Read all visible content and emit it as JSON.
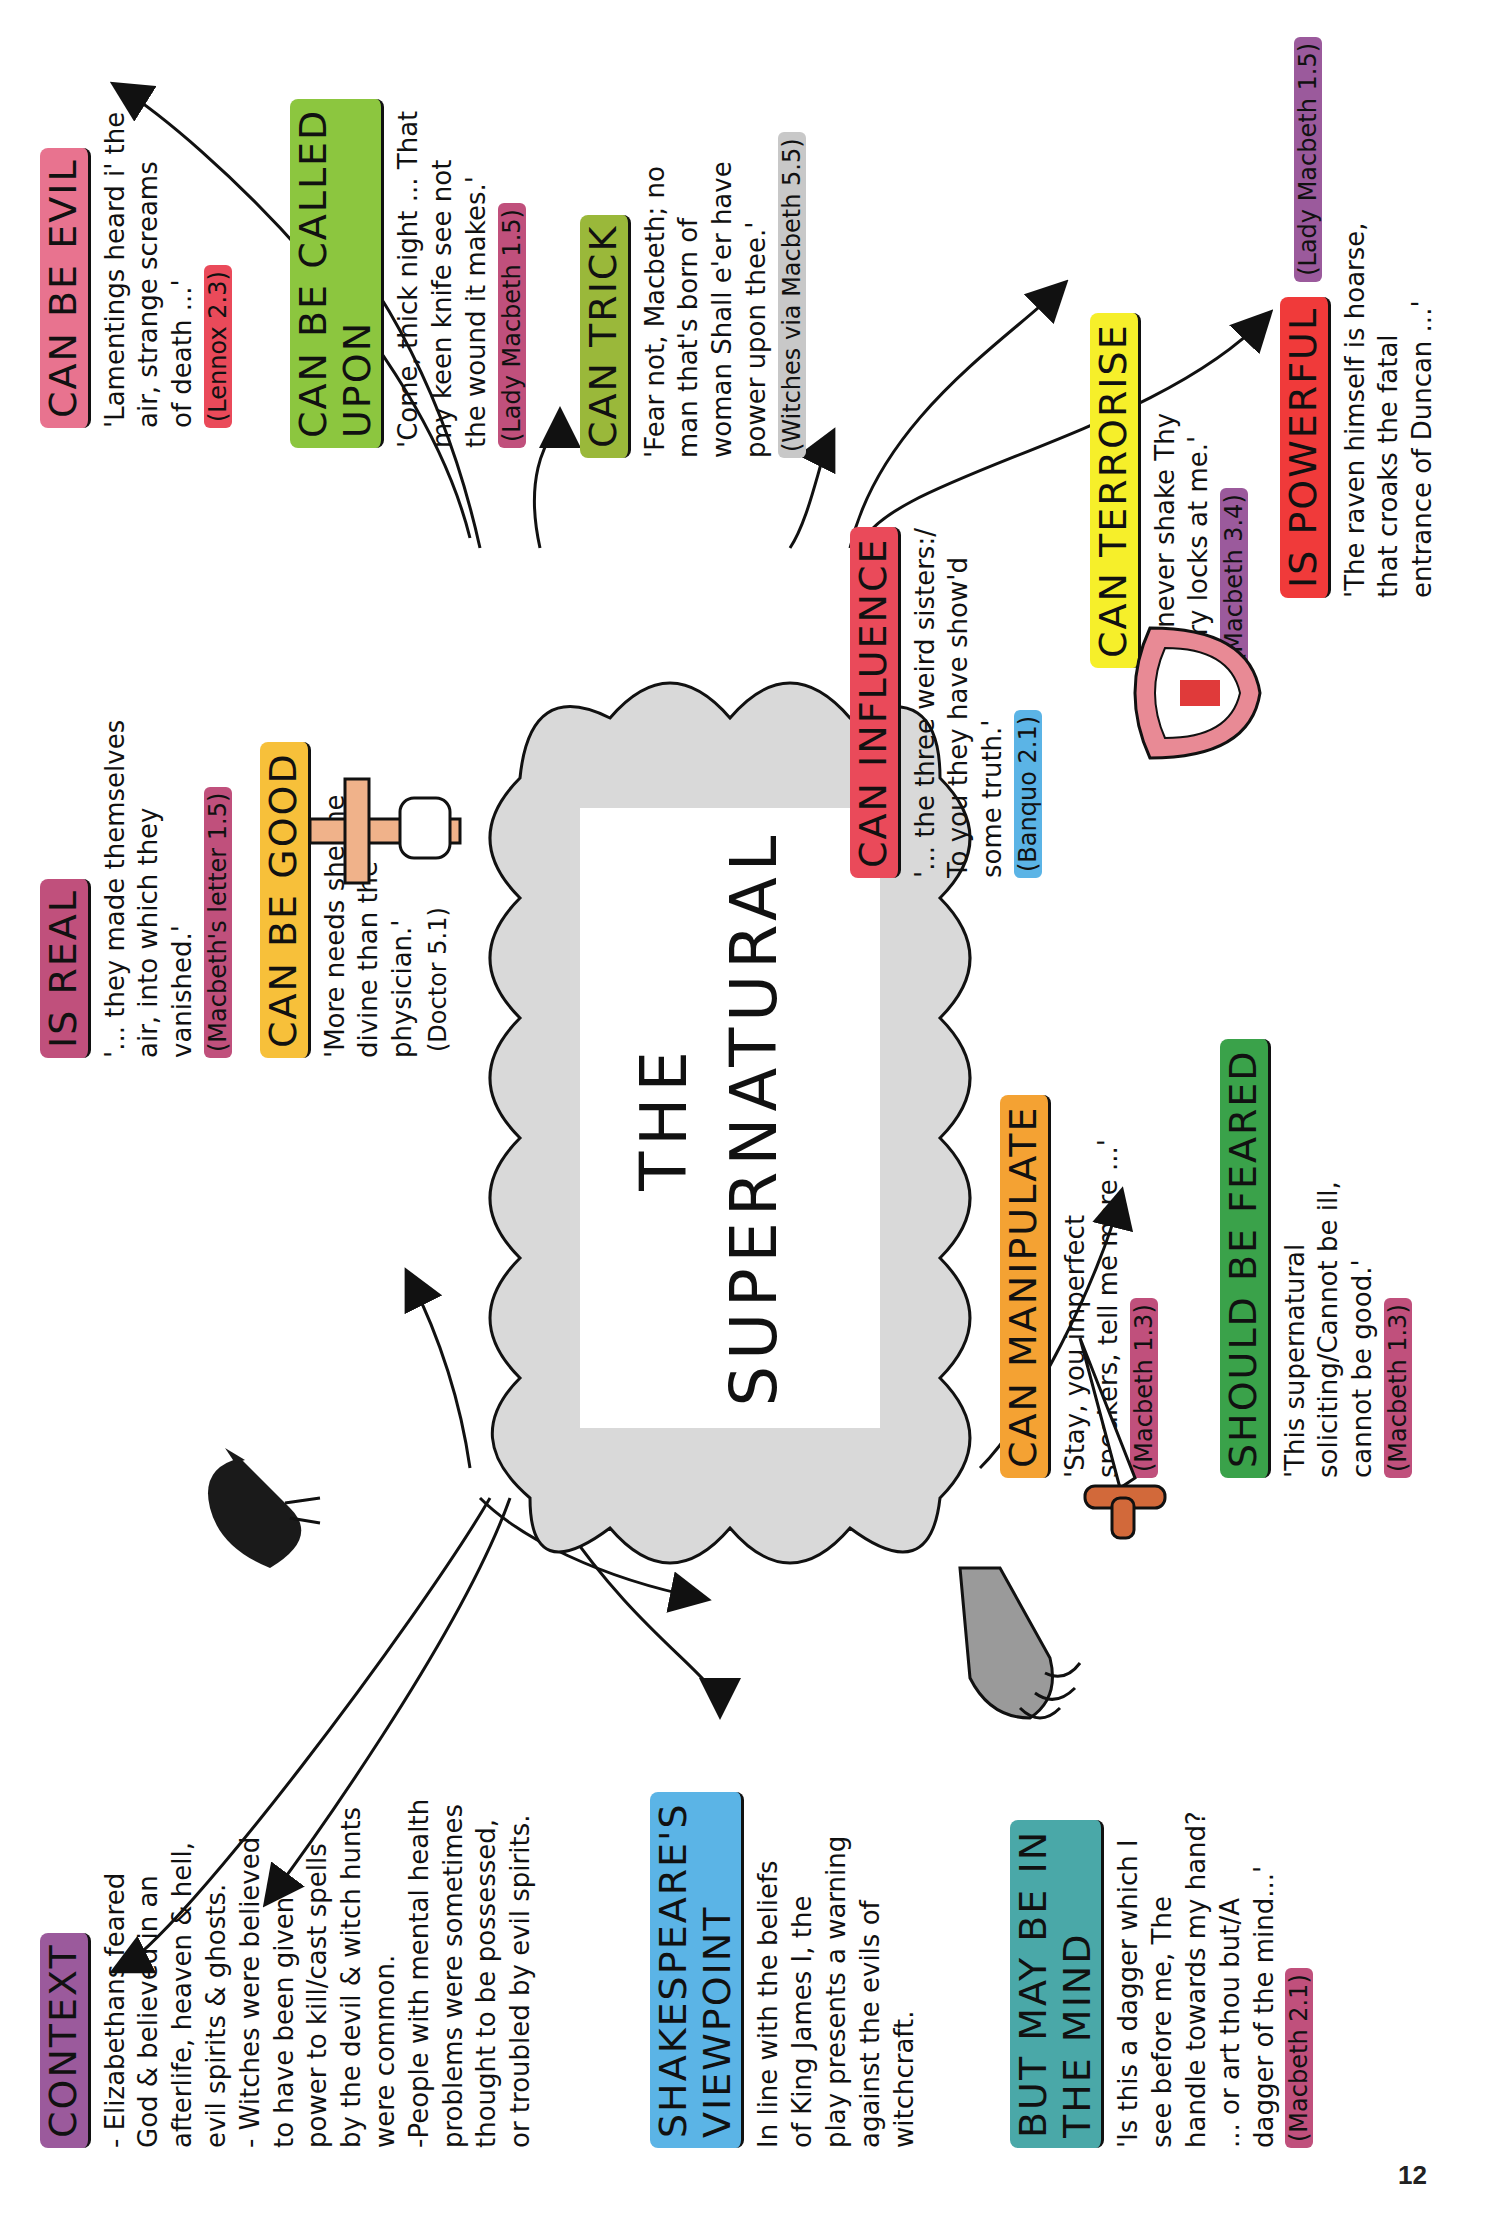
{
  "page": {
    "number": "12"
  },
  "central": {
    "line1": "THE",
    "line2": "SUPERNATURAL"
  },
  "colors": {
    "pink": "#e8738f",
    "green": "#8cc63f",
    "olive": "#9ab83a",
    "red": "#ea4a5a",
    "yellow": "#f6ef2a",
    "bright_red": "#f03a3a",
    "purple": "#9b5a9c",
    "magenta": "#c0507c",
    "gold": "#f7c03a",
    "orange": "#f4a233",
    "dark_green": "#3aa24a",
    "blue": "#5bb4e6",
    "teal": "#4aa8a8",
    "grey": "#c8c8c8",
    "cloud": "#d9d9d9"
  },
  "nodes": {
    "can_be_evil": {
      "heading": "CAN BE EVIL",
      "quote": "'Lamentings heard i' the\nair, strange screams\nof death ...'",
      "cite": "(Lennox 2.3)"
    },
    "can_be_called_upon": {
      "heading": "CAN BE CALLED\nUPON",
      "quote": "'Come, thick night ... That\nmy keen knife see not\nthe wound it makes.'",
      "cite": "(Lady Macbeth 1.5)"
    },
    "can_trick": {
      "heading": "CAN TRICK",
      "quote": "'Fear not, Macbeth; no\nman that's born of\nwoman Shall e'er have\npower upon thee.'",
      "cite": "(Witches via Macbeth 5.5)"
    },
    "can_influence": {
      "heading": "CAN INFLUENCE",
      "quote": "'... the three weird sisters:/\nTo you they have show'd\nsome truth.'",
      "cite": "(Banquo 2.1)"
    },
    "can_terrorise": {
      "heading": "CAN TERRORISE",
      "quote": "'... never shake Thy\ngory locks at me.'",
      "cite": "(Macbeth 3.4)"
    },
    "is_powerful": {
      "heading": "IS POWERFUL",
      "quote": "'The raven himself is hoarse,\nthat croaks the fatal\nentrance of Duncan ...'",
      "cite": "(Lady Macbeth 1.5)"
    },
    "is_real": {
      "heading": "IS REAL",
      "quote": "'... they made themselves\nair, into which they\nvanished.'",
      "cite": "(Macbeth's letter 1.5)"
    },
    "can_be_good": {
      "heading": "CAN BE GOOD",
      "quote": "'More needs she the\ndivine than the\nphysician.'",
      "cite": "(Doctor 5.1)"
    },
    "can_manipulate": {
      "heading": "CAN MANIPULATE",
      "quote": "'Stay, you imperfect\nspeakers, tell me more ...'",
      "cite": "(Macbeth 1.3)"
    },
    "should_be_feared": {
      "heading": "SHOULD BE FEARED",
      "quote": "'This supernatural\nsoliciting/Cannot be ill,\ncannot be good.'",
      "cite": "(Macbeth 1.3)"
    },
    "context": {
      "heading": "CONTEXT",
      "text": "- Elizabethans feared\nGod & believed in an\nafterlife, heaven & hell,\nevil spirits & ghosts.\n- Witches were believed\nto have been given\npower to kill/cast spells\nby the devil & witch hunts\nwere common.\n-People with mental health\nproblems were sometimes\nthought to be possessed,\nor troubled by evil spirits."
    },
    "viewpoint": {
      "heading": "SHAKESPEARE'S\nVIEWPOINT",
      "text": "In line with the beliefs\nof King James I, the\nplay presents a warning\nagainst the evils of\nwitchcraft."
    },
    "in_the_mind": {
      "heading": "BUT MAY BE IN\nTHE MIND",
      "quote": "'Is this a dagger which I\nsee before me, The\nhandle towards my hand?\n... or art thou but/A\ndagger of the mind...'",
      "cite": "(Macbeth 2.1)"
    }
  },
  "illustrations": [
    "raven",
    "cross-in-hand",
    "fanged-mouth",
    "dagger",
    "clawed-hand"
  ]
}
